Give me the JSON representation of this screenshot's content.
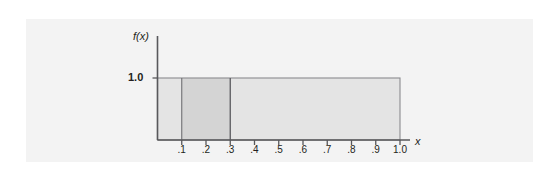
{
  "figure": {
    "background_color": "#ffffff",
    "panel_color": "#f3f3f3"
  },
  "chart_data": {
    "type": "area",
    "title": "",
    "subtitle": "",
    "xlabel": "x",
    "ylabel": "f(x)",
    "grid": false,
    "legend": null,
    "xlim": [
      0.0,
      1.0
    ],
    "ylim": [
      0.0,
      1.0
    ],
    "x_tick_labels": [
      ".1",
      ".2",
      ".3",
      ".4",
      ".5",
      ".6",
      ".7",
      ".8",
      ".9",
      "1.0"
    ],
    "x_tick_values": [
      0.1,
      0.2,
      0.3,
      0.4,
      0.5,
      0.6,
      0.7,
      0.8,
      0.9,
      1.0
    ],
    "y_tick_labels": [
      "1.0"
    ],
    "y_tick_values": [
      1.0
    ],
    "series": [
      {
        "name": "f(x)",
        "type": "step",
        "x": [
          0.0,
          1.0
        ],
        "values": [
          1.0,
          1.0
        ],
        "constant_value": 1.0
      }
    ],
    "regions": [
      {
        "name": "region-left",
        "x_start": 0.0,
        "x_end": 0.1,
        "height": 1.0,
        "area": 0.1,
        "fill_color": "#e3e3e3",
        "highlighted": false
      },
      {
        "name": "region-highlight",
        "x_start": 0.1,
        "x_end": 0.3,
        "height": 1.0,
        "area": 0.2,
        "fill_color": "#d5d5d5",
        "highlighted": true
      },
      {
        "name": "region-right",
        "x_start": 0.3,
        "x_end": 1.0,
        "height": 1.0,
        "area": 0.7,
        "fill_color": "#e3e3e3",
        "highlighted": false
      }
    ],
    "dividers": [
      0.1,
      0.3
    ],
    "axis_color": "#58585b",
    "outline_color": "#808084"
  }
}
